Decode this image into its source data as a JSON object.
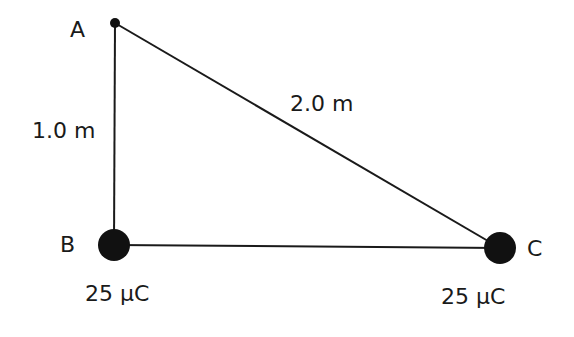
{
  "diagram": {
    "points": {
      "A": {
        "label": "A"
      },
      "B": {
        "label": "B",
        "charge": "25 μC"
      },
      "C": {
        "label": "C",
        "charge": "25 μC"
      }
    },
    "sides": {
      "AB": "1.0 m",
      "AC": "2.0 m"
    }
  }
}
